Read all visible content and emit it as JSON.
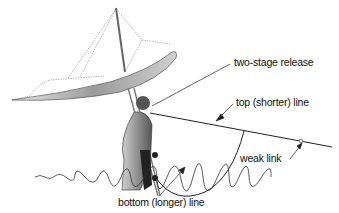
{
  "diagram": {
    "labels": {
      "two_stage_release": "two-stage release",
      "top_line": "top (shorter) line",
      "weak_link": "weak link",
      "bottom_line": "bottom (longer) line"
    },
    "colors": {
      "line": "#222222",
      "text": "#111111",
      "background": "#ffffff"
    }
  }
}
